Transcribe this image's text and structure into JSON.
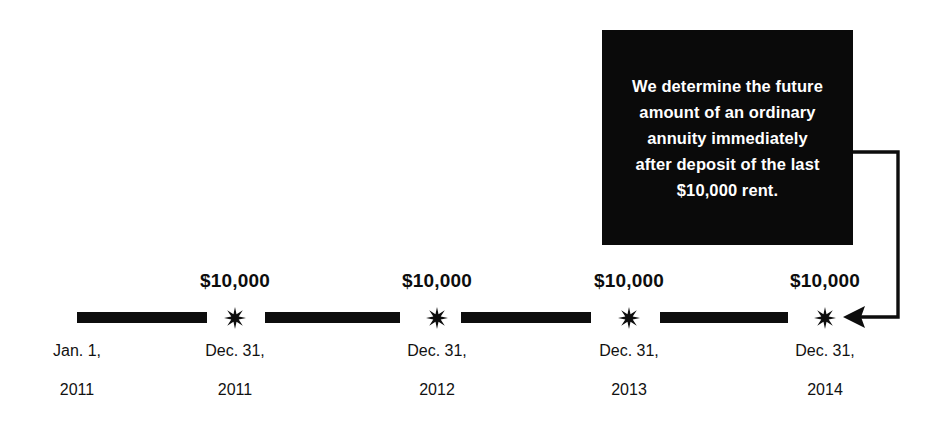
{
  "callout": {
    "lines": [
      "We determine the future",
      "amount of an ordinary",
      "annuity immediately",
      "after deposit of the last",
      "$10,000 rent."
    ],
    "background_color": "#0a0a0a",
    "text_color": "#ffffff"
  },
  "arrow": {
    "name": "elbow-arrow-pointing-to-last-deposit",
    "color": "#0d0d0d",
    "points_to": "Dec. 31, 2014"
  },
  "timeline": {
    "line_color": "#0d0d0d",
    "marker_icon": "starburst-icon",
    "segments": [
      {
        "x1": 77,
        "x2": 207
      },
      {
        "x1": 265,
        "x2": 400
      },
      {
        "x1": 461,
        "x2": 591
      },
      {
        "x1": 660,
        "x2": 788
      }
    ],
    "points": [
      {
        "id": "start",
        "x": 77,
        "amount": "",
        "date": "Jan. 1,",
        "year": "2011",
        "has_marker": false
      },
      {
        "id": "deposit-1",
        "x": 235,
        "amount": "$10,000",
        "date": "Dec. 31,",
        "year": "2011",
        "has_marker": true
      },
      {
        "id": "deposit-2",
        "x": 437,
        "amount": "$10,000",
        "date": "Dec. 31,",
        "year": "2012",
        "has_marker": true
      },
      {
        "id": "deposit-3",
        "x": 629,
        "amount": "$10,000",
        "date": "Dec. 31,",
        "year": "2013",
        "has_marker": true
      },
      {
        "id": "deposit-4",
        "x": 825,
        "amount": "$10,000",
        "date": "Dec. 31,",
        "year": "2014",
        "has_marker": true
      }
    ]
  }
}
